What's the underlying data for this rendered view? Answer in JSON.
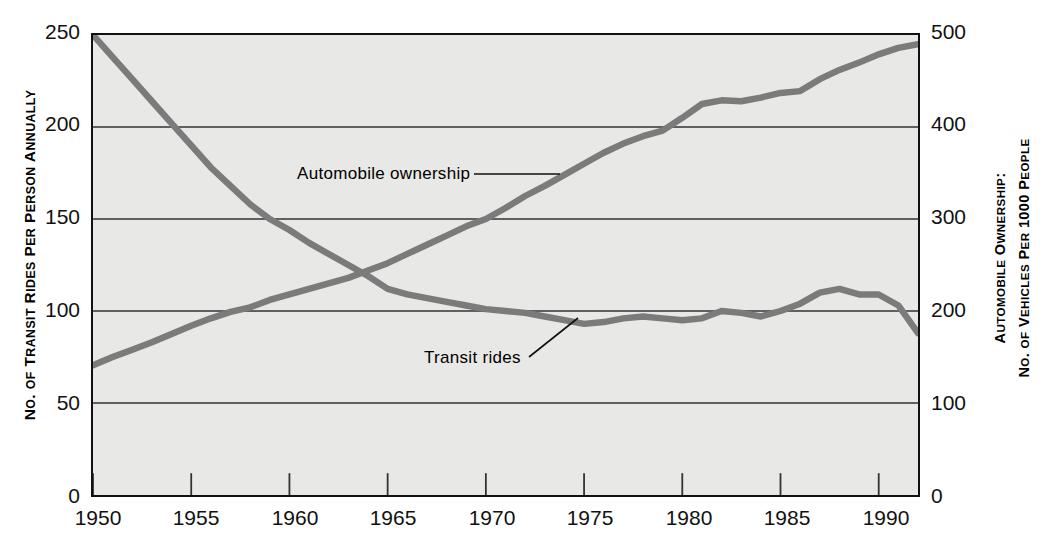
{
  "chart_data": {
    "type": "line",
    "title": "",
    "xlabel": "",
    "ylabel": "No. of Transit Rides per Person Annually",
    "y2label": "Automobile Ownership: No. of Vehicles per 1000 People",
    "grid": true,
    "legend": "annotations-inline",
    "xlim": [
      1950,
      1992
    ],
    "ylim": [
      0,
      250
    ],
    "y2lim": [
      0,
      500
    ],
    "xticks": [
      1950,
      1955,
      1960,
      1965,
      1970,
      1975,
      1980,
      1985,
      1990
    ],
    "yticks": [
      0,
      50,
      100,
      150,
      200,
      250
    ],
    "y2ticks": [
      0,
      100,
      200,
      300,
      400,
      500
    ],
    "x": [
      1950,
      1951,
      1952,
      1953,
      1954,
      1955,
      1956,
      1957,
      1958,
      1959,
      1960,
      1961,
      1962,
      1963,
      1964,
      1965,
      1966,
      1967,
      1968,
      1969,
      1970,
      1971,
      1972,
      1973,
      1974,
      1975,
      1976,
      1977,
      1978,
      1979,
      1980,
      1981,
      1982,
      1983,
      1984,
      1985,
      1986,
      1987,
      1988,
      1989,
      1990,
      1991,
      1992
    ],
    "series": [
      {
        "name": "Transit rides",
        "axis": "left",
        "units": "rides per person per year",
        "color": "#7b7b7b",
        "values": [
          250,
          238,
          226,
          214,
          202,
          190,
          178,
          168,
          158,
          150,
          144,
          137,
          131,
          125,
          119,
          112,
          109,
          107,
          105,
          103,
          101,
          100,
          99,
          97,
          95,
          93,
          94,
          96,
          97,
          96,
          95,
          96,
          100,
          99,
          97,
          100,
          104,
          110,
          112,
          109,
          109,
          103,
          88
        ]
      },
      {
        "name": "Automobile ownership",
        "axis": "right",
        "units": "vehicles per 1000 people",
        "color": "#7b7b7b",
        "values": [
          141,
          150,
          158,
          166,
          175,
          184,
          192,
          199,
          204,
          212,
          218,
          224,
          230,
          236,
          244,
          252,
          262,
          272,
          282,
          292,
          300,
          312,
          325,
          336,
          348,
          360,
          372,
          382,
          390,
          396,
          410,
          425,
          429,
          428,
          432,
          437,
          439,
          452,
          462,
          470,
          479,
          486,
          490
        ]
      }
    ],
    "annotations": [
      {
        "name": "Automobile ownership",
        "text": "Automobile ownership",
        "leader": "horizontal"
      },
      {
        "name": "Transit rides",
        "text": "Transit rides",
        "leader": "diagonal"
      }
    ]
  },
  "axes": {
    "left_title_parts": {
      "n": "N",
      "o_rest": "o. ",
      "of": "of ",
      "t": "T",
      "transit_rest": "ransit ",
      "r": "R",
      "rides_rest": "ides ",
      "p": "P",
      "per_rest": "er ",
      "pe": "P",
      "person_rest": "erson ",
      "a": "A",
      "annually_rest": "nnually"
    },
    "left_title": "NO. OF TRANSIT RIDES PER PERSON ANNUALLY",
    "right_title_line1": "AUTOMOBILE OWNERSHIP:",
    "right_title_line2": "NO. OF VEHICLES PER 1000 PEOPLE",
    "y_left_ticks": [
      "250",
      "200",
      "150",
      "100",
      "50",
      "0"
    ],
    "y_right_ticks": [
      "500",
      "400",
      "300",
      "200",
      "100",
      "0"
    ],
    "x_ticks": [
      "1950",
      "1955",
      "1960",
      "1965",
      "1970",
      "1975",
      "1980",
      "1985",
      "1990"
    ]
  },
  "annotations": {
    "automobile": "Automobile  ownership",
    "transit": "Transit  rides"
  },
  "colors": {
    "line": "#7b7b7b",
    "plot_background": "#e8e8e6",
    "axis": "#111111",
    "gridline": "#333333",
    "text": "#000000"
  }
}
